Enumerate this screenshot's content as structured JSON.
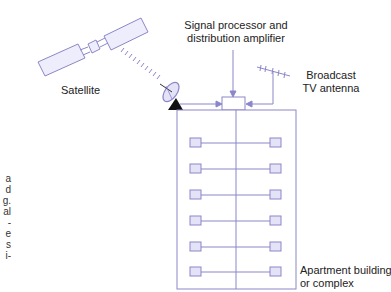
{
  "diagram": {
    "labels": {
      "satellite": "Satellite",
      "processor_line1": "Signal processor and",
      "processor_line2": "distribution amplifier",
      "antenna_line1": "Broadcast",
      "antenna_line2": "TV antenna",
      "building_line1": "Apartment building",
      "building_line2": "or complex"
    },
    "cropped_left_text": [
      "a",
      "d",
      "g.",
      "al",
      "-",
      "e",
      "s",
      "i-"
    ],
    "floors": 6,
    "colors": {
      "stroke": "#8b86c9",
      "fill": "#e4e2f7",
      "dish_base": "#111111",
      "text": "#222222"
    }
  }
}
